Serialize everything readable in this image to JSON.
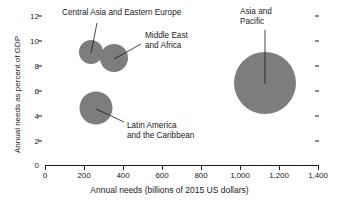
{
  "chart_data": {
    "type": "scatter",
    "title": "",
    "subtitle": "",
    "xlabel": "Annual needs (billions of 2015 US dollars)",
    "ylabel": "Annual needs as percent of GDP",
    "xlim": [
      0,
      1400
    ],
    "ylim": [
      0,
      12
    ],
    "xticks": [
      "0",
      "200",
      "400",
      "600",
      "800",
      "1,000",
      "1,200",
      "1,400"
    ],
    "xtick_values": [
      0,
      200,
      400,
      600,
      800,
      1000,
      1200,
      1400
    ],
    "yticks": [
      "0",
      "2",
      "4",
      "6",
      "8",
      "10",
      "12"
    ],
    "ytick_values": [
      0,
      2,
      4,
      6,
      8,
      10,
      12
    ],
    "grid": false,
    "legend": "none",
    "bubble_color": "#7d7d7d",
    "axis_color": "#1a1a1a",
    "series": [
      {
        "name": "Central Asia and Eastern Europe",
        "x": 236,
        "y": 9.1,
        "radius_px": 12
      },
      {
        "name": "Middle East and Africa",
        "x": 354,
        "y": 8.6,
        "radius_px": 14
      },
      {
        "name": "Latin America and the Caribbean",
        "x": 264,
        "y": 4.6,
        "radius_px": 16.5
      },
      {
        "name": "Asia and Pacific",
        "x": 1128,
        "y": 6.6,
        "radius_px": 31
      }
    ],
    "annotations": [
      {
        "text": "Central Asia and Eastern Europe",
        "label_x": 62,
        "label_y": 12
      },
      {
        "text": "Middle East\nand Africa",
        "label_x": 144,
        "label_y": 34
      },
      {
        "text": "Latin America\nand the Caribbean",
        "label_x": 127,
        "label_y": 110
      },
      {
        "text": "Asia and\nPacific",
        "label_x": 240,
        "label_y": 10
      }
    ]
  }
}
